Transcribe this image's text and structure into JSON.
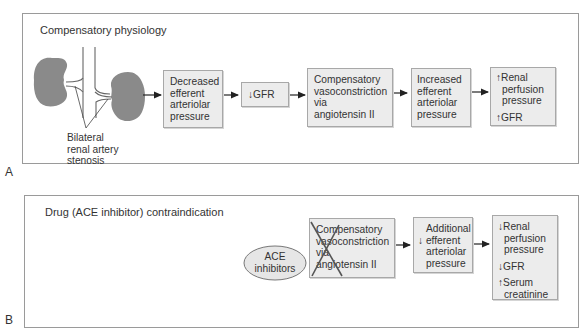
{
  "panel_a": {
    "letter": "A",
    "title": "Compensatory physiology",
    "anatomy_label": [
      "Bilateral",
      "renal artery",
      "stenosis"
    ],
    "boxes": [
      {
        "lines": [
          "Decreased",
          "efferent",
          "arteriolar",
          "pressure"
        ]
      },
      {
        "lines": [
          "↓GFR"
        ]
      },
      {
        "lines": [
          "Compensatory",
          "vasoconstriction",
          "via",
          "angiotensin II"
        ]
      },
      {
        "lines": [
          "Increased",
          "efferent",
          "arteriolar",
          "pressure"
        ]
      },
      {
        "lines": [
          "↑Renal",
          "perfusion",
          "pressure"
        ],
        "extra": "↑GFR"
      }
    ]
  },
  "panel_b": {
    "letter": "B",
    "title": "Drug (ACE inhibitor) contraindication",
    "drug": [
      "ACE",
      "inhibitors"
    ],
    "boxes": [
      {
        "lines": [
          "Compensatory",
          "vasoconstriction",
          "via",
          "angiotensin II"
        ],
        "crossed_out": true
      },
      {
        "lines": [
          "Additional",
          "↓  efferent",
          "arteriolar",
          "pressure"
        ]
      },
      {
        "lines": [
          "↓Renal",
          "perfusion",
          "pressure"
        ],
        "extra1": "↓GFR",
        "extra2": [
          "↑Serum",
          "creatinine"
        ]
      }
    ]
  },
  "colors": {
    "kidney": "#8a8a8a",
    "box_fill": "#ececec",
    "box_border": "#a8a8a8",
    "panel_border": "#9a9a9a",
    "text": "#333333",
    "ellipse_fill": "#e6e6e6",
    "cross": "#555555"
  }
}
